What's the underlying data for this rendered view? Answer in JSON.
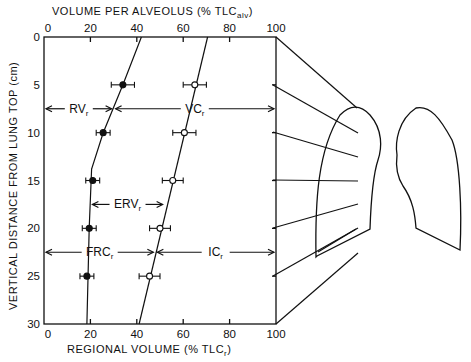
{
  "chart_data": {
    "type": "scatter",
    "title": "",
    "top_axis_label": "VOLUME PER ALVEOLUS (% TLC",
    "top_axis_label_sub": "alv",
    "bottom_axis_label": "REGIONAL VOLUME (% TLC",
    "bottom_axis_label_sub": "r",
    "ylabel": "VERTICAL DISTANCE FROM LUNG TOP (cm)",
    "xlim": [
      0,
      100
    ],
    "ylim": [
      0,
      30
    ],
    "y_inverted": true,
    "x_ticks": [
      "0",
      "20",
      "40",
      "60",
      "80",
      "100"
    ],
    "y_ticks": [
      "0",
      "5",
      "10",
      "15",
      "20",
      "25",
      "30"
    ],
    "grid": false,
    "series": [
      {
        "name": "RV_r (residual volume, filled circles)",
        "marker": "filled-circle",
        "points": [
          {
            "y": 5,
            "x": 34,
            "err": 5
          },
          {
            "y": 10,
            "x": 25.5,
            "err": 3
          },
          {
            "y": 15,
            "x": 21,
            "err": 3
          },
          {
            "y": 20,
            "x": 19.5,
            "err": 3
          },
          {
            "y": 25,
            "x": 18.5,
            "err": 3
          }
        ],
        "fit_line": [
          [
            42,
            0
          ],
          [
            34,
            5
          ],
          [
            25.5,
            10
          ],
          [
            20.5,
            13.8
          ],
          [
            19.5,
            20
          ],
          [
            18.5,
            30
          ]
        ]
      },
      {
        "name": "FRC+IC boundary / TLC fraction (open circles)",
        "marker": "open-circle",
        "points": [
          {
            "y": 5,
            "x": 65,
            "err": 5
          },
          {
            "y": 10,
            "x": 60.5,
            "err": 5
          },
          {
            "y": 15,
            "x": 55.5,
            "err": 4.5
          },
          {
            "y": 20,
            "x": 50,
            "err": 4.5
          },
          {
            "y": 25,
            "x": 45.5,
            "err": 4.5
          }
        ],
        "fit_line": [
          [
            70.5,
            0
          ],
          [
            41,
            30
          ]
        ]
      }
    ],
    "annotations": [
      {
        "label": "RV",
        "sub": "r",
        "y": 7.5,
        "from": 0,
        "to": 30
      },
      {
        "label": "VC",
        "sub": "r",
        "y": 7.5,
        "from": 30,
        "to": 100
      },
      {
        "label": "ERV",
        "sub": "r",
        "y": 17.5,
        "from": 20,
        "to": 52
      },
      {
        "label": "FRC",
        "sub": "r",
        "y": 22.5,
        "from": 0,
        "to": 48
      },
      {
        "label": "IC",
        "sub": "r",
        "y": 22.5,
        "from": 48,
        "to": 100
      }
    ]
  },
  "labels": {
    "top_axis": "VOLUME PER ALVEOLUS (% TLC",
    "top_axis_sub": "alv",
    "bottom_axis": "REGIONAL VOLUME (% TLC",
    "bottom_axis_sub": "r",
    "y_axis": "VERTICAL DISTANCE FROM LUNG TOP (cm)",
    "close_paren": ")",
    "rv": "RV",
    "vc": "VC",
    "erv": "ERV",
    "frc": "FRC",
    "ic": "IC",
    "sub_r": "r"
  }
}
